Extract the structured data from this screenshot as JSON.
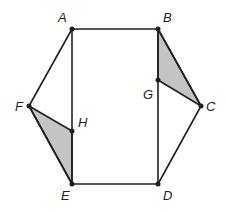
{
  "figure": {
    "colors": {
      "stroke": "#231f20",
      "shade": "#c4c4c4",
      "background": "#ffffff"
    },
    "points": {
      "A": {
        "label": "A",
        "x": 72,
        "y": 29
      },
      "B": {
        "label": "B",
        "x": 158,
        "y": 29
      },
      "C": {
        "label": "C",
        "x": 201,
        "y": 106
      },
      "D": {
        "label": "D",
        "x": 158,
        "y": 184
      },
      "E": {
        "label": "E",
        "x": 72,
        "y": 184
      },
      "F": {
        "label": "F",
        "x": 29,
        "y": 106
      },
      "G": {
        "label": "G",
        "x": 158,
        "y": 80
      },
      "H": {
        "label": "H",
        "x": 72,
        "y": 131
      }
    },
    "labels": {
      "A": "A",
      "B": "B",
      "C": "C",
      "D": "D",
      "E": "E",
      "F": "F",
      "G": "G",
      "H": "H"
    },
    "shaded_triangles": [
      [
        "B",
        "G",
        "C"
      ],
      [
        "F",
        "H",
        "E"
      ]
    ],
    "segments": [
      [
        "A",
        "B"
      ],
      [
        "B",
        "C"
      ],
      [
        "C",
        "D"
      ],
      [
        "D",
        "E"
      ],
      [
        "E",
        "F"
      ],
      [
        "F",
        "A"
      ],
      [
        "A",
        "E"
      ],
      [
        "B",
        "D"
      ],
      [
        "G",
        "C"
      ],
      [
        "F",
        "H"
      ]
    ]
  }
}
